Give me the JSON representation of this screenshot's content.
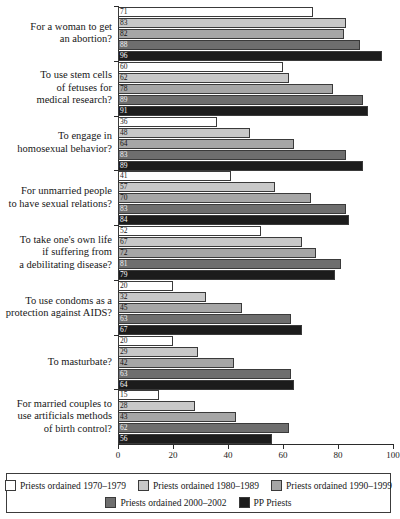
{
  "chart_data": {
    "type": "bar",
    "orientation": "horizontal",
    "title": "",
    "xlabel": "",
    "ylabel": "",
    "xlim": [
      0,
      100
    ],
    "xticks": [
      0,
      20,
      40,
      60,
      80,
      100
    ],
    "grid": false,
    "legend_position": "bottom",
    "categories": [
      "For a woman to get an abortion?",
      "To use stem cells of fetuses for medical research?",
      "To engage in homosexual behavior?",
      "For unmarried people to have sexual relations?",
      "To take one's own life if suffering from a debilitating disease?",
      "To use condoms as a protection against AIDS?",
      "To masturbate?",
      "For married couples to use artificials methods of birth control?"
    ],
    "category_lines": [
      [
        "For a woman to get",
        "an abortion?"
      ],
      [
        "To use stem cells",
        "of fetuses for",
        "medical research?"
      ],
      [
        "To engage in",
        "homosexual behavior?"
      ],
      [
        "For unmarried people",
        "to have sexual relations?"
      ],
      [
        "To take one's own life",
        "if suffering from",
        "a debilitating disease?"
      ],
      [
        "To use condoms as a",
        "protection against AIDS?"
      ],
      [
        "To masturbate?"
      ],
      [
        "For married couples to",
        "use artificials methods",
        "of birth control?"
      ]
    ],
    "series": [
      {
        "name": "Priests ordained 1970–1979",
        "color": "#ffffff",
        "values": [
          71,
          60,
          36,
          41,
          52,
          20,
          20,
          15
        ]
      },
      {
        "name": "Priests ordained 1980–1989",
        "color": "#c8c8c8",
        "values": [
          83,
          62,
          48,
          57,
          67,
          32,
          29,
          28
        ]
      },
      {
        "name": "Priests ordained 1990–1999",
        "color": "#a6a6a6",
        "values": [
          82,
          78,
          64,
          70,
          72,
          45,
          42,
          43
        ]
      },
      {
        "name": "Priests ordained 2000–2002",
        "color": "#6e6e6e",
        "values": [
          88,
          89,
          83,
          83,
          81,
          63,
          63,
          62
        ]
      },
      {
        "name": "PP Priests",
        "color": "#1c1c1c",
        "values": [
          96,
          91,
          89,
          84,
          79,
          67,
          64,
          56
        ]
      }
    ]
  }
}
